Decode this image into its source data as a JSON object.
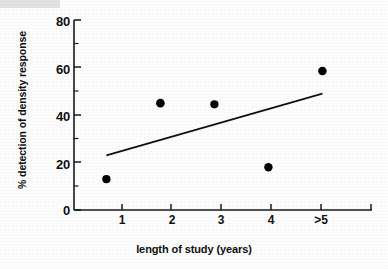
{
  "chart_data": {
    "type": "scatter",
    "title": "",
    "xlabel": "length of study (years)",
    "ylabel": "% detection of density response",
    "categories": [
      "1",
      "2",
      "3",
      "4",
      ">5"
    ],
    "x": [
      1,
      2,
      3,
      4,
      5
    ],
    "values": [
      13,
      45,
      44.5,
      18,
      58.5
    ],
    "series": [
      {
        "name": "% detection of density response",
        "type": "scatter",
        "marker": "filled-circle",
        "color": "#000000",
        "points": [
          {
            "x": 1,
            "xlabel": "1",
            "y": 13
          },
          {
            "x": 2,
            "xlabel": "2",
            "y": 45
          },
          {
            "x": 3,
            "xlabel": "3",
            "y": 44.5
          },
          {
            "x": 4,
            "xlabel": "4",
            "y": 18
          },
          {
            "x": 5,
            "xlabel": ">5",
            "y": 58.5
          }
        ]
      },
      {
        "name": "trend line",
        "type": "line",
        "color": "#000000",
        "points": [
          {
            "x": 1,
            "y": 23
          },
          {
            "x": 5,
            "y": 49
          }
        ]
      }
    ],
    "xlim": [
      0.4,
      5.9
    ],
    "ylim": [
      0,
      80
    ],
    "yticks": [
      0,
      20,
      40,
      60,
      80
    ],
    "ytick_labels": [
      "0",
      "20",
      "40",
      "60",
      "80"
    ],
    "yminor_ticks": [
      10,
      30,
      50,
      70
    ],
    "xtick_labels": [
      "1",
      "2",
      "3",
      "4",
      ">5"
    ],
    "grid": false,
    "legend": null,
    "legend_position": "none",
    "axis_style": "left-and-bottom-spines",
    "colors": {
      "marker": "#000000",
      "line": "#000000",
      "axis": "#1a1a1a",
      "background": "#ffffff"
    }
  }
}
